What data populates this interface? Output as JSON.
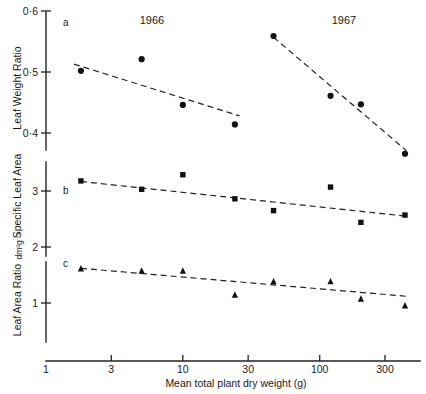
{
  "chart_data": {
    "type": "scatter",
    "title": "",
    "xlabel": "Mean total plant dry weight (g)",
    "xscale": "log",
    "xlim": [
      1,
      500
    ],
    "xticks": [
      1,
      3,
      10,
      30,
      100,
      300
    ],
    "xticklabels": [
      "1",
      "3",
      "10",
      "30",
      "100",
      "300"
    ],
    "grid": false,
    "legend": false,
    "group_labels": [
      "1966",
      "1967"
    ],
    "panels": [
      {
        "letter": "a",
        "ylabel": "Leaf Weight Ratio",
        "yunit": "",
        "ylim": [
          0.35,
          0.6
        ],
        "yticks": [
          0.4,
          0.5,
          0.6
        ],
        "yticklabels": [
          "0·4",
          "0·5",
          "0·6"
        ],
        "marker": "circle",
        "series": [
          {
            "name": "1966",
            "x": [
              1.8,
              5.0,
              10.0,
              24.0
            ],
            "y": [
              0.502,
              0.521,
              0.446,
              0.414
            ],
            "fit_x": [
              1.6,
              26.0
            ],
            "fit_y": [
              0.513,
              0.428
            ]
          },
          {
            "name": "1967",
            "x": [
              46.0,
              120.0,
              200.0,
              420.0
            ],
            "y": [
              0.559,
              0.461,
              0.447,
              0.366
            ],
            "fit_x": [
              46.0,
              430.0
            ],
            "fit_y": [
              0.557,
              0.371
            ]
          }
        ]
      },
      {
        "letter": "b",
        "ylabel": "Specific Leaf Area",
        "yunit": "dm²g⁻¹",
        "ylim": [
          1.8,
          3.5
        ],
        "yticks": [
          2,
          3
        ],
        "yticklabels": [
          "2",
          "3"
        ],
        "marker": "square",
        "series": [
          {
            "name": "all",
            "x": [
              1.8,
              5.0,
              10.0,
              24.0,
              46.0,
              120.0,
              200.0,
              420.0
            ],
            "y": [
              3.18,
              3.03,
              3.29,
              2.86,
              2.65,
              3.07,
              2.44,
              2.57
            ],
            "fit_x": [
              1.8,
              430.0
            ],
            "fit_y": [
              3.17,
              2.55
            ]
          }
        ]
      },
      {
        "letter": "c",
        "ylabel": "Leaf Area Ratio",
        "yunit": "",
        "ylim": [
          0.7,
          1.9
        ],
        "yticks": [
          1
        ],
        "yticklabels": [
          "1"
        ],
        "marker": "triangle",
        "series": [
          {
            "name": "all",
            "x": [
              1.8,
              5.0,
              10.0,
              24.0,
              46.0,
              120.0,
              200.0,
              420.0
            ],
            "y": [
              1.62,
              1.58,
              1.58,
              1.15,
              1.39,
              1.39,
              1.08,
              0.96
            ],
            "fit_x": [
              1.8,
              430.0
            ],
            "fit_y": [
              1.62,
              1.12
            ]
          }
        ]
      }
    ]
  }
}
